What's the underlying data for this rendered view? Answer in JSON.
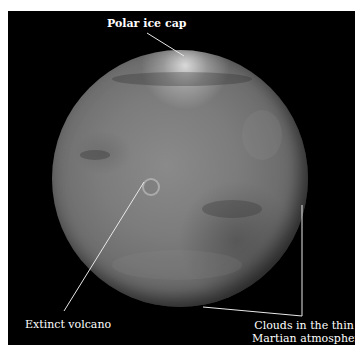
{
  "figure": {
    "background_color": "#000000",
    "border_color": "#ffffff",
    "planet_tone": "grayscale",
    "annotations": [
      {
        "label": "Polar ice cap"
      },
      {
        "label": "Extinct volcano"
      },
      {
        "label_line1": "Clouds in the thin",
        "label_line2": "Martian atmosphere"
      }
    ],
    "leader_color": "#e8e8e8"
  }
}
